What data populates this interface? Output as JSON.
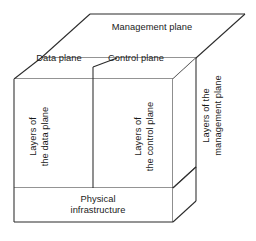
{
  "diagram": {
    "type": "3d-isometric-block-diagram",
    "colors": {
      "stroke": "#2b2b2b",
      "stroke_light": "#4a4a4a",
      "face": "#ffffff",
      "text": "#1a1a1a",
      "background": "#ffffff"
    },
    "labels": {
      "management_plane": "Management plane",
      "data_plane": "Data plane",
      "control_plane": "Control plane",
      "physical_infrastructure": "Physical\ninfrastructure",
      "layers_of_the_data_plane": "Layers of\nthe data plane",
      "layers_of_the_control_plane": "Layers of\nthe control plane",
      "layers_of_the_management_plane": "Layers of the\nmanagement plane"
    },
    "blocks": [
      {
        "name": "management-plane-top",
        "label": "Management plane",
        "orientation": "top-face"
      },
      {
        "name": "data-plane-top",
        "label": "Data plane",
        "orientation": "top-face"
      },
      {
        "name": "control-plane-top",
        "label": "Control plane",
        "orientation": "top-face"
      },
      {
        "name": "data-plane-front",
        "label": "Layers of the data plane",
        "orientation": "front-face-vertical-text"
      },
      {
        "name": "control-plane-front",
        "label": "Layers of the control plane",
        "orientation": "front-face-vertical-text"
      },
      {
        "name": "management-plane-side",
        "label": "Layers of the management plane",
        "orientation": "side-face-vertical-text"
      },
      {
        "name": "physical-infrastructure-base",
        "label": "Physical infrastructure",
        "orientation": "front-face"
      }
    ]
  }
}
